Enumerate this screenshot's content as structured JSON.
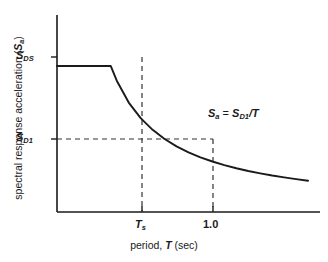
{
  "chart_data": {
    "type": "line",
    "title": "",
    "xlabel": "period, T (sec)",
    "ylabel": "spectral response acceleration (Sa)",
    "x_tick_labels": [
      "Ts",
      "1.0"
    ],
    "y_tick_labels": [
      "SDS",
      "SD1"
    ],
    "xlim": [
      0,
      2.2
    ],
    "ylim": [
      0,
      1.35
    ],
    "grid": false,
    "legend": null,
    "annotations": [
      "Sa = SD1/T"
    ],
    "series": [
      {
        "name": "design response spectrum",
        "x": [
          0.0,
          0.2,
          0.4,
          0.45,
          0.5,
          0.6,
          0.7,
          0.8,
          0.9,
          1.0,
          1.1,
          1.2,
          1.3,
          1.4,
          1.5,
          1.6,
          1.7,
          1.8,
          1.9,
          2.0,
          2.1
        ],
        "y": [
          1.0,
          1.0,
          1.0,
          1.0,
          0.9,
          0.75,
          0.643,
          0.563,
          0.5,
          0.45,
          0.409,
          0.375,
          0.346,
          0.321,
          0.3,
          0.281,
          0.265,
          0.25,
          0.237,
          0.225,
          0.214
        ]
      }
    ],
    "key_points": [
      {
        "label": "Ts",
        "x": 0.45,
        "y": 1.0
      },
      {
        "label": "1.0",
        "x": 1.0,
        "y": 0.45
      }
    ],
    "plateau_value_label": "SDS",
    "corner_period_label": "Ts",
    "reference_period": 1.0,
    "reference_value_label": "SD1"
  },
  "axis": {
    "x_title_parts": {
      "prefix": "period, ",
      "symbol": "T",
      "suffix": " (sec)"
    },
    "y_title_parts": {
      "prefix": "spectral response acceleration (",
      "symbol": "S",
      "symbol_sub": "a",
      "suffix": ")"
    }
  },
  "ticks": {
    "y_upper": {
      "symbol": "S",
      "sub": "DS"
    },
    "y_lower": {
      "symbol": "S",
      "sub": "D1"
    },
    "x_corner": {
      "symbol": "T",
      "sub": "s"
    },
    "x_one": "1.0"
  },
  "annotation": {
    "lhs_symbol": "S",
    "lhs_sub": "a",
    "equals": " = ",
    "rhs_symbol": "S",
    "rhs_sub": "D1",
    "rhs_tail": "/T"
  },
  "colors": {
    "curve": "#1a1a1a",
    "axis": "#1a1a1a",
    "dashed": "#333333",
    "background": "#ffffff"
  }
}
